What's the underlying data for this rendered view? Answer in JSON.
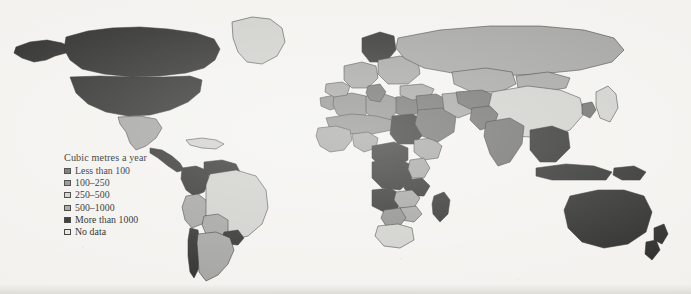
{
  "figure": {
    "type": "choropleth-world-map",
    "background_color": "#f3f2ef"
  },
  "legend": {
    "title": "Cubic metres a year",
    "items": [
      {
        "label": "Less than 100",
        "color": "#6e6e6b",
        "range_min": 0,
        "range_max": 100
      },
      {
        "label": "100–250",
        "color": "#8d8d8a",
        "range_min": 100,
        "range_max": 250
      },
      {
        "label": "250–500",
        "color": "#cfcfcb",
        "range_min": 250,
        "range_max": 500
      },
      {
        "label": "500–1000",
        "color": "#a3a3a0",
        "range_min": 500,
        "range_max": 1000
      },
      {
        "label": "More than 1000",
        "color": "#2f2f2d",
        "range_min": 1000,
        "range_max": null
      },
      {
        "label": "No data",
        "color": "#e6e5e1",
        "range_min": null,
        "range_max": null
      }
    ]
  },
  "chart_data": {
    "type": "heatmap",
    "title": "Cubic metres a year",
    "categories": [
      "Less than 100",
      "100–250",
      "250–500",
      "500–1000",
      "More than 1000",
      "No data"
    ],
    "values": [
      "#6e6e6b",
      "#8d8d8a",
      "#cfcfcb",
      "#a3a3a0",
      "#2f2f2d",
      "#e6e5e1"
    ],
    "xlabel": "",
    "ylabel": "",
    "legend_position": "lower-left",
    "grid": false,
    "regions": [
      {
        "name": "Canada",
        "class": "More than 1000"
      },
      {
        "name": "United States",
        "class": "More than 1000"
      },
      {
        "name": "Alaska",
        "class": "More than 1000"
      },
      {
        "name": "Greenland",
        "class": "250–500"
      },
      {
        "name": "Mexico",
        "class": "500–1000"
      },
      {
        "name": "Central America",
        "class": "More than 1000"
      },
      {
        "name": "Caribbean",
        "class": "250–500"
      },
      {
        "name": "Colombia",
        "class": "More than 1000"
      },
      {
        "name": "Venezuela",
        "class": "More than 1000"
      },
      {
        "name": "Peru",
        "class": "500–1000"
      },
      {
        "name": "Brazil",
        "class": "250–500"
      },
      {
        "name": "Bolivia",
        "class": "500–1000"
      },
      {
        "name": "Paraguay",
        "class": "More than 1000"
      },
      {
        "name": "Argentina",
        "class": "500–1000"
      },
      {
        "name": "Chile",
        "class": "More than 1000"
      },
      {
        "name": "Morocco",
        "class": "100–250"
      },
      {
        "name": "Algeria",
        "class": "100–250"
      },
      {
        "name": "Libya",
        "class": "100–250"
      },
      {
        "name": "Egypt",
        "class": "Less than 100"
      },
      {
        "name": "Sudan",
        "class": "More than 1000"
      },
      {
        "name": "Sahel",
        "class": "100–250"
      },
      {
        "name": "West Africa",
        "class": "500–1000"
      },
      {
        "name": "Nigeria",
        "class": "500–1000"
      },
      {
        "name": "Central Africa",
        "class": "More than 1000"
      },
      {
        "name": "DR Congo",
        "class": "More than 1000"
      },
      {
        "name": "Ethiopia",
        "class": "500–1000"
      },
      {
        "name": "Kenya",
        "class": "500–1000"
      },
      {
        "name": "Tanzania",
        "class": "More than 1000"
      },
      {
        "name": "Angola",
        "class": "More than 1000"
      },
      {
        "name": "Zambia",
        "class": "500–1000"
      },
      {
        "name": "Zimbabwe",
        "class": "500–1000"
      },
      {
        "name": "Botswana",
        "class": "100–250"
      },
      {
        "name": "South Africa",
        "class": "250–500"
      },
      {
        "name": "Madagascar",
        "class": "More than 1000"
      },
      {
        "name": "Western Europe",
        "class": "500–1000"
      },
      {
        "name": "Scandinavia",
        "class": "More than 1000"
      },
      {
        "name": "Iberia",
        "class": "500–1000"
      },
      {
        "name": "Italy",
        "class": "Less than 100"
      },
      {
        "name": "Eastern Europe",
        "class": "500–1000"
      },
      {
        "name": "Turkey",
        "class": "500–1000"
      },
      {
        "name": "Middle East",
        "class": "Less than 100"
      },
      {
        "name": "Saudi Arabia",
        "class": "Less than 100"
      },
      {
        "name": "Iran",
        "class": "500–1000"
      },
      {
        "name": "Russia",
        "class": "500–1000"
      },
      {
        "name": "Kazakhstan",
        "class": "500–1000"
      },
      {
        "name": "Central Asia",
        "class": "Less than 100"
      },
      {
        "name": "China",
        "class": "250–500"
      },
      {
        "name": "Mongolia",
        "class": "500–1000"
      },
      {
        "name": "India",
        "class": "Less than 100"
      },
      {
        "name": "Pakistan",
        "class": "Less than 100"
      },
      {
        "name": "Southeast Asia",
        "class": "More than 1000"
      },
      {
        "name": "Indonesia",
        "class": "More than 1000"
      },
      {
        "name": "Japan",
        "class": "250–500"
      },
      {
        "name": "Korea",
        "class": "Less than 100"
      },
      {
        "name": "Papua New Guinea",
        "class": "More than 1000"
      },
      {
        "name": "Australia",
        "class": "More than 1000"
      },
      {
        "name": "New Zealand",
        "class": "More than 1000"
      }
    ]
  }
}
